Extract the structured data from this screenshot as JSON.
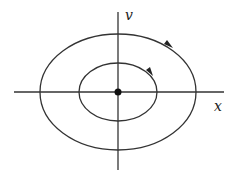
{
  "diagram": {
    "type": "phase-portrait",
    "axes": {
      "horizontal_label": "x",
      "vertical_label": "v"
    },
    "origin": {
      "marker": "filled-dot"
    },
    "orbits": [
      {
        "name": "inner",
        "direction": "clockwise"
      },
      {
        "name": "outer",
        "direction": "clockwise"
      }
    ],
    "colors": {
      "stroke": "#333333",
      "background": "#ffffff"
    }
  }
}
